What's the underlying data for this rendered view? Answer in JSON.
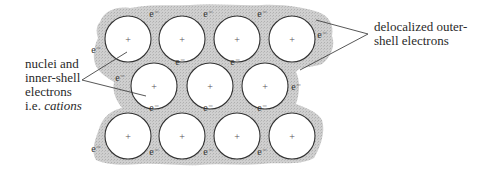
{
  "colors": {
    "background": "#ffffff",
    "electron_sea": "#c9c9c9",
    "circle_stroke": "#333333",
    "circle_fill": "#ffffff",
    "text": "#2a2a2a",
    "pointer_line": "#444444"
  },
  "labels": {
    "left": {
      "line1": "nuclei and",
      "line2": "inner-shell",
      "line3": "electrons",
      "line4_prefix": "i.e. ",
      "line4_italic": "cations"
    },
    "right": {
      "line1": "delocalized outer-",
      "line2": "shell electrons"
    }
  },
  "cation_symbol": "+",
  "electron_symbol": "e⁻",
  "cations": [
    {
      "row": 1,
      "cx": 128,
      "cy": 39
    },
    {
      "row": 1,
      "cx": 182,
      "cy": 39
    },
    {
      "row": 1,
      "cx": 237,
      "cy": 39
    },
    {
      "row": 1,
      "cx": 292,
      "cy": 39
    },
    {
      "row": 2,
      "cx": 154,
      "cy": 86
    },
    {
      "row": 2,
      "cx": 210,
      "cy": 86
    },
    {
      "row": 2,
      "cx": 265,
      "cy": 86
    },
    {
      "row": 3,
      "cx": 128,
      "cy": 136
    },
    {
      "row": 3,
      "cx": 182,
      "cy": 136
    },
    {
      "row": 3,
      "cx": 237,
      "cy": 136
    },
    {
      "row": 3,
      "cx": 292,
      "cy": 136
    }
  ],
  "cation_radius": 23,
  "electrons": [
    {
      "x": 154,
      "y": 17
    },
    {
      "x": 208,
      "y": 17
    },
    {
      "x": 262,
      "y": 17
    },
    {
      "x": 96,
      "y": 53
    },
    {
      "x": 322,
      "y": 38
    },
    {
      "x": 180,
      "y": 65
    },
    {
      "x": 235,
      "y": 65
    },
    {
      "x": 120,
      "y": 81
    },
    {
      "x": 296,
      "y": 90
    },
    {
      "x": 154,
      "y": 111
    },
    {
      "x": 208,
      "y": 111
    },
    {
      "x": 262,
      "y": 111
    },
    {
      "x": 96,
      "y": 152
    },
    {
      "x": 154,
      "y": 155
    },
    {
      "x": 208,
      "y": 155
    },
    {
      "x": 262,
      "y": 155
    }
  ]
}
